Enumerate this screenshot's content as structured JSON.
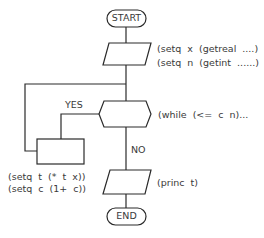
{
  "flowchart": {
    "start": {
      "label": "START"
    },
    "input": {
      "lines": [
        "(setq  x  (getreal  ....)",
        "(setq  n  (getint  ......)"
      ]
    },
    "decision": {
      "label": "(while  (<=  c  n)...",
      "yes": "YES",
      "no": "NO"
    },
    "process": {
      "lines": [
        "(setq  t  (*  t  x))",
        "(setq  c  (1+  c))"
      ]
    },
    "output": {
      "label": "(princ  t)"
    },
    "end": {
      "label": "END"
    }
  },
  "colors": {
    "stroke": "#2a2a2a",
    "text": "#3a3a3a",
    "background": "#ffffff"
  }
}
